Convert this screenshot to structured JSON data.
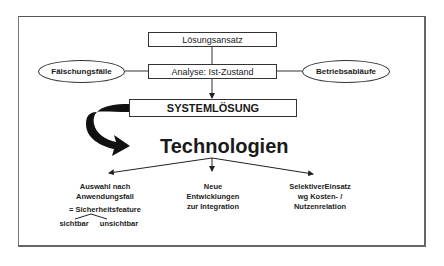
{
  "diagram": {
    "top_box": "Lösungsansatz",
    "analysis_box": "Analyse: Ist-Zustand",
    "left_ellipse": "Fälschungsfälle",
    "right_ellipse": "Betriebsabläufe",
    "system_box": "SYSTEMLÖSUNG",
    "technologies_title": "Technologien",
    "branches": [
      {
        "lines": [
          "Auswahl nach",
          "Anwendungsfall"
        ],
        "note": "= Sicherheitsfeature",
        "sub_left": "sichtbar",
        "sub_right": "unsichtbar"
      },
      {
        "lines": [
          "Neue",
          "Entwicklungen",
          "zur Integration"
        ]
      },
      {
        "lines": [
          "SelektiverEinsatz",
          "wg Kosten- /",
          "Nutzenrelation"
        ]
      }
    ]
  }
}
